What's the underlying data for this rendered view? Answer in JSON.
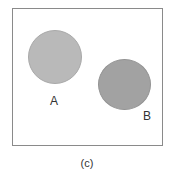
{
  "diagram": {
    "circles": [
      {
        "label": "A",
        "color": "#b9b9b9",
        "border": "#a9a9a9"
      },
      {
        "label": "B",
        "color": "#a2a2a2",
        "border": "#939393"
      }
    ],
    "caption": "(c)"
  }
}
